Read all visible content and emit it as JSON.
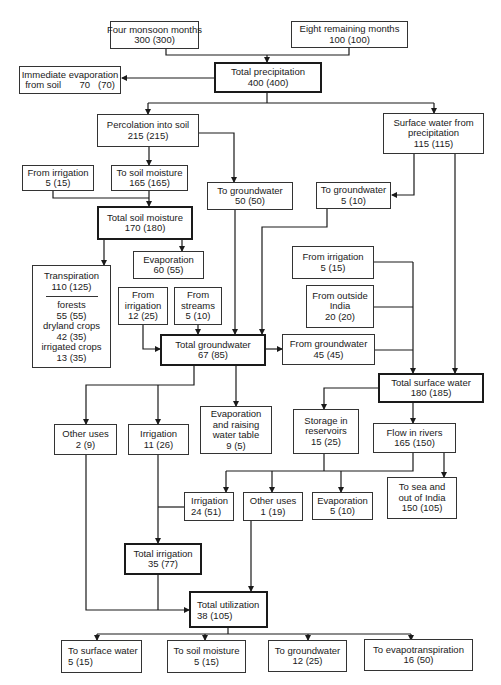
{
  "diagram": {
    "nodes": {
      "four_monsoon": {
        "label": "Four monsoon months",
        "value": "300   (300)"
      },
      "eight_remaining": {
        "label": "Eight remaining months",
        "value": "100   (100)"
      },
      "total_precipitation": {
        "label": "Total precipitation",
        "value": "400   (400)"
      },
      "immediate_evaporation": {
        "label": "Immediate evaporation",
        "value": "from soil       70   (70)"
      },
      "percolation": {
        "label": "Percolation into soil",
        "value": "215   (215)"
      },
      "surface_from_precip": {
        "label": "Surface water from",
        "label2": "precipitation",
        "value": "115   (115)"
      },
      "from_irrigation_1": {
        "label": "From irrigation",
        "value": "5   (15)"
      },
      "to_soil_moisture": {
        "label": "To soil moisture",
        "value": "165   (165)"
      },
      "to_groundwater_1": {
        "label": "To groundwater",
        "value": "50   (50)"
      },
      "to_groundwater_2": {
        "label": "To groundwater",
        "value": "5   (10)"
      },
      "total_soil_moisture": {
        "label": "Total soil moisture",
        "value": "170   (180)"
      },
      "evaporation_1": {
        "label": "Evaporation",
        "value": "60   (55)"
      },
      "transpiration": {
        "label": "Transpiration",
        "value": "110   (125)",
        "items": [
          {
            "label": "forests",
            "value": "55  (55)"
          },
          {
            "label": "dryland crops",
            "value": "42  (35)"
          },
          {
            "label": "irrigated crops",
            "value": "13  (35)"
          }
        ]
      },
      "from_irrigation_2": {
        "label": "From",
        "label2": "irrigation",
        "value": "12  (25)"
      },
      "from_streams": {
        "label": "From",
        "label2": "streams",
        "value": "5  (10)"
      },
      "from_irrigation_3": {
        "label": "From irrigation",
        "value": "5   (15)"
      },
      "from_outside_india": {
        "label": "From outside",
        "label2": "India",
        "value": "20   (20)"
      },
      "total_groundwater": {
        "label": "Total groundwater",
        "value": "67   (85)"
      },
      "from_groundwater": {
        "label": "From groundwater",
        "value": "45   (45)"
      },
      "total_surface_water": {
        "label": "Total surface water",
        "value": "180   (185)"
      },
      "other_uses_1": {
        "label": "Other uses",
        "value": "2   (9)"
      },
      "irrigation_1": {
        "label": "Irrigation",
        "value": "11   (26)"
      },
      "evap_raising": {
        "label": "Evaporation",
        "label2": "and raising",
        "label3": "water table",
        "value": "9   (5)"
      },
      "storage_reservoirs": {
        "label": "Storage in",
        "label2": "reservoirs",
        "value": "15   (25)"
      },
      "flow_in_rivers": {
        "label": "Flow in rivers",
        "value": "165   (150)"
      },
      "irrigation_2": {
        "label": "Irrigation",
        "value": "24   (51)"
      },
      "other_uses_2": {
        "label": "Other uses",
        "value": "1   (19)"
      },
      "evaporation_2": {
        "label": "Evaporation",
        "value": "5   (10)"
      },
      "to_sea": {
        "label": "To sea and",
        "label2": "out of India",
        "value": "150   (105)"
      },
      "total_irrigation": {
        "label": "Total irrigation",
        "value": "35   (77)"
      },
      "total_utilization": {
        "label": "Total utilization",
        "value": "38   (105)"
      },
      "to_surface_water": {
        "label": "To surface water",
        "value": "5   (15)"
      },
      "to_soil_moisture_out": {
        "label": "To soil moisture",
        "value": "5   (15)"
      },
      "to_groundwater_out": {
        "label": "To groundwater",
        "value": "12   (25)"
      },
      "to_evapotranspiration": {
        "label": "To evapotranspiration",
        "value": "16   (50)"
      }
    },
    "colors": {
      "line": "#1a1a1a",
      "border": "#333333",
      "background": "#ffffff"
    }
  }
}
